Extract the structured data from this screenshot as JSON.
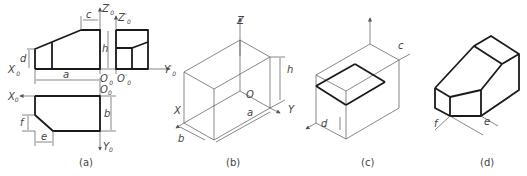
{
  "figure": {
    "panels": [
      {
        "id": "a",
        "caption": "(a)",
        "description": "orthographic front, side and top views"
      },
      {
        "id": "b",
        "caption": "(b)",
        "description": "isometric bounding box"
      },
      {
        "id": "c",
        "caption": "(c)",
        "description": "isometric box with cut plane"
      },
      {
        "id": "d",
        "caption": "(d)",
        "description": "finished isometric solid"
      }
    ],
    "labels": {
      "a": {
        "Z0p": "Z",
        "Z0p_sup": "′",
        "Z0pp": "Z",
        "Z0pp_sup": "″",
        "X0p": "X",
        "X0p_sup": "′",
        "Y0pp": "Y",
        "Y0pp_sup": "″",
        "O0p": "O",
        "O0p_sup": "′",
        "O0pp": "O",
        "O0pp_sup": "″",
        "O0": "O",
        "X0": "X",
        "Y0": "Y",
        "sub0": "0",
        "c": "c",
        "d": "d",
        "h": "h",
        "a": "a",
        "b": "b",
        "e": "e",
        "f": "f"
      },
      "b": {
        "Z": "Z",
        "X": "X",
        "Y": "Y",
        "O": "O",
        "h": "h",
        "a": "a",
        "b": "b"
      },
      "c": {
        "c": "c",
        "d": "d"
      },
      "d": {
        "e": "e",
        "f": "f"
      }
    }
  }
}
